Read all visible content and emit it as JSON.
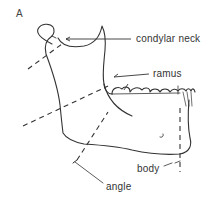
{
  "figure": {
    "panel_label": "A",
    "labels": {
      "condylar_neck": "condylar neck",
      "ramus": "ramus",
      "body": "body",
      "angle": "angle"
    },
    "colors": {
      "line": "#333333",
      "background": "#ffffff"
    }
  }
}
